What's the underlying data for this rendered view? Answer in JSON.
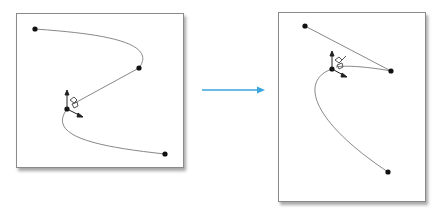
{
  "diagram": {
    "arrow_color": "#3aa6dc",
    "before": {
      "points": [
        [
          35,
          29
        ],
        [
          139,
          68
        ],
        [
          67,
          109
        ],
        [
          165,
          154
        ]
      ]
    },
    "after": {
      "points": [
        [
          305,
          26
        ],
        [
          391,
          71
        ],
        [
          332,
          69
        ],
        [
          388,
          172
        ]
      ]
    }
  }
}
